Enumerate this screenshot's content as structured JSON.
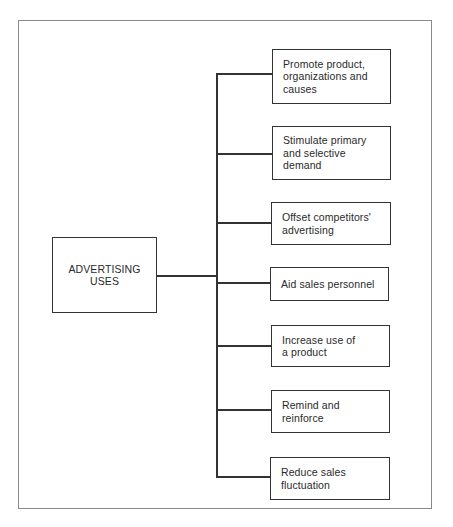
{
  "diagram": {
    "type": "tree",
    "orientation": "left-to-right",
    "root": {
      "label": "ADVERTISING\nUSES"
    },
    "children": [
      {
        "label": "Promote product,\norganizations and\ncauses"
      },
      {
        "label": "Stimulate primary\nand selective\ndemand"
      },
      {
        "label": "Offset competitors'\nadvertising"
      },
      {
        "label": "Aid sales personnel"
      },
      {
        "label": "Increase use of\na product"
      },
      {
        "label": "Remind and\nreinforce"
      },
      {
        "label": "Reduce sales\nfluctuation"
      }
    ],
    "colors": {
      "stroke": "#333333",
      "frame": "#8a8a8a",
      "text": "#2a2a2a",
      "background": "#ffffff"
    }
  }
}
